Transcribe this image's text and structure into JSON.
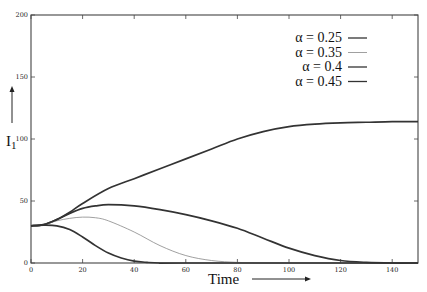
{
  "chart_data": {
    "type": "line",
    "title": "",
    "xlabel": "Time",
    "ylabel": "I_1",
    "xlim": [
      0,
      150
    ],
    "ylim": [
      0,
      200
    ],
    "x_ticks": [
      0,
      20,
      40,
      60,
      80,
      100,
      120,
      140
    ],
    "y_ticks": [
      0,
      50,
      100,
      150,
      200
    ],
    "grid": false,
    "legend_position": "upper right",
    "series": [
      {
        "name": "α = 0.25",
        "style": "thick",
        "color": "#333333",
        "x": [
          0,
          5,
          10,
          15,
          20,
          30,
          40,
          50,
          60,
          70,
          80,
          90,
          100,
          110,
          120,
          130,
          140,
          150
        ],
        "y": [
          30,
          31,
          35,
          41,
          48,
          60,
          68,
          76,
          84,
          92,
          100,
          106,
          110,
          112,
          113,
          113.5,
          114,
          114
        ]
      },
      {
        "name": "α = 0.35",
        "style": "thin",
        "color": "#888888",
        "x": [
          0,
          5,
          10,
          15,
          20,
          25,
          30,
          40,
          50,
          60,
          70,
          80,
          90,
          100,
          150
        ],
        "y": [
          30,
          31,
          34,
          36,
          37,
          36.5,
          34,
          25,
          14,
          6,
          2,
          0.5,
          0,
          0,
          0
        ]
      },
      {
        "name": "α = 0.4",
        "style": "thick",
        "color": "#333333",
        "x": [
          0,
          5,
          10,
          15,
          20,
          25,
          30,
          40,
          50,
          60,
          70,
          80,
          90,
          100,
          110,
          120,
          130,
          140,
          150
        ],
        "y": [
          30,
          31,
          35,
          40,
          44,
          46,
          47,
          46,
          43,
          39,
          34,
          28,
          20,
          12,
          6,
          2,
          0.5,
          0,
          0
        ]
      },
      {
        "name": "α = 0.45",
        "style": "thick",
        "color": "#333333",
        "x": [
          0,
          5,
          10,
          15,
          20,
          25,
          30,
          35,
          40,
          45,
          50,
          60,
          150
        ],
        "y": [
          30,
          30.5,
          30,
          27,
          21,
          14,
          8,
          4,
          1.5,
          0.5,
          0,
          0,
          0
        ]
      }
    ]
  },
  "legend": {
    "items": [
      "α = 0.25",
      "α = 0.35",
      "α = 0.4",
      "α = 0.45"
    ]
  },
  "axes": {
    "xlabel": "Time",
    "ylabel": "I",
    "ylabel_sub": "1"
  }
}
